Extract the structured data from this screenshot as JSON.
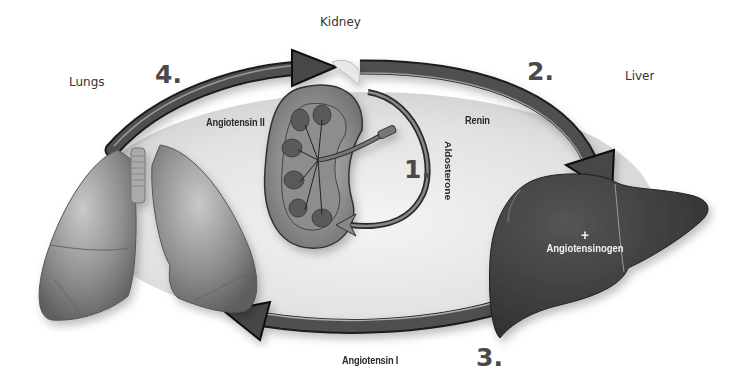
{
  "diagram": {
    "type": "physiological-cycle",
    "organs": [
      {
        "id": "kidney",
        "label": "Kidney"
      },
      {
        "id": "liver",
        "label": "Liver"
      },
      {
        "id": "lungs",
        "label": "Lungs"
      }
    ],
    "steps": [
      {
        "number": "1.",
        "label": "Aldosterone",
        "from": "kidney",
        "to": "kidney"
      },
      {
        "number": "2.",
        "label": "Renin",
        "from": "kidney",
        "to": "liver"
      },
      {
        "number": "3.",
        "label": "Angiotensin I",
        "from": "liver",
        "to": "lungs"
      },
      {
        "number": "4.",
        "label": "Angiotensin II",
        "from": "lungs",
        "to": "kidney"
      }
    ],
    "liver_annotation": {
      "plus": "+",
      "label": "Angiotensinogen"
    }
  },
  "colors": {
    "background": "#ffffff",
    "ellipse_fill": "#e6e6e6",
    "arrow": "#4d4d4d",
    "arrow_outline": "#1a1a1a",
    "organ_dark": "#3f3f3f",
    "organ_mid": "#8a8a8a",
    "text": "#222222",
    "step_number": "#4a4a4a"
  }
}
